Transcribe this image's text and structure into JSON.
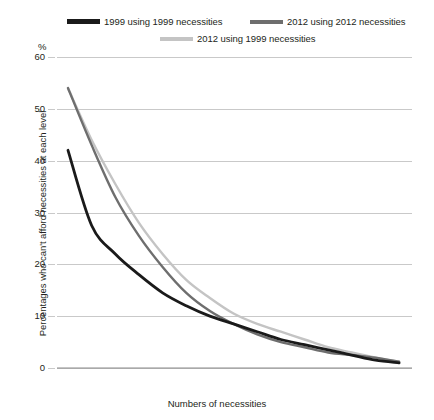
{
  "chart_data": {
    "type": "line",
    "title": "",
    "xlabel": "Numbers of necessities",
    "ylabel": "Percentages who can't afford necessities at each level",
    "unit_symbol": "%",
    "categories": [
      "1+",
      "2+",
      "3+",
      "4+",
      "5+",
      "6+",
      "7+",
      "8+",
      "9+",
      "10+",
      "11+",
      "12+",
      "13+",
      "14+",
      "15+"
    ],
    "yticks": [
      0,
      10,
      20,
      30,
      40,
      50,
      60
    ],
    "ylim": [
      0,
      60
    ],
    "grid": true,
    "legend_position": "top",
    "series": [
      {
        "name": "1999 using 1999 necessities",
        "color": "#1a1a1a",
        "values": [
          42,
          27.5,
          22,
          18,
          14.5,
          12,
          10,
          8.5,
          7,
          5.5,
          4.5,
          3.5,
          2.5,
          1.5,
          1
        ]
      },
      {
        "name": "2012 using 2012 necessities",
        "color": "#6e6e6e",
        "values": [
          54,
          43,
          33,
          25.5,
          19.5,
          14.5,
          11,
          8.5,
          6.5,
          5,
          4,
          3,
          2.5,
          2,
          1.2
        ]
      },
      {
        "name": "2012 using 1999 necessities",
        "color": "#c4c4c4",
        "values": [
          54,
          44,
          35.5,
          28,
          22,
          17,
          13.5,
          10.5,
          8.5,
          7,
          5.5,
          4,
          3,
          2,
          1.2
        ]
      }
    ]
  }
}
